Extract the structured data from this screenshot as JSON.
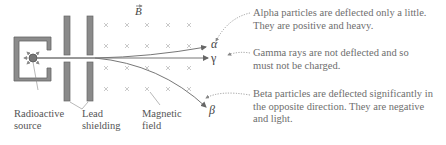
{
  "diagram": {
    "field_symbol": "B",
    "labels": {
      "source": [
        "Radioactive",
        "source"
      ],
      "shielding": [
        "Lead",
        "shielding"
      ],
      "field": [
        "Magnetic",
        "field"
      ]
    },
    "rays": {
      "alpha": "α",
      "gamma": "γ",
      "beta": "β"
    },
    "notes": {
      "alpha": [
        "Alpha particles are deflected only a little.",
        "They are positive and heavy."
      ],
      "gamma": [
        "Gamma rays are not deflected and so",
        "must not be charged."
      ],
      "beta": [
        "Beta particles are deflected significantly in",
        "the opposite direction. They are negative",
        "and light."
      ]
    },
    "colors": {
      "lead": "#8a8a8a",
      "lead_border": "#666666",
      "ray": "#777777",
      "field_x": "#bbbbbb",
      "note_text": "#6e6e6e"
    }
  }
}
